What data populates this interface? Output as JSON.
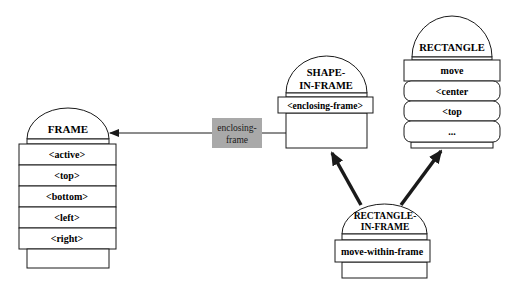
{
  "diagram": {
    "nodes": [
      {
        "id": "frame",
        "title": [
          "FRAME"
        ],
        "slots": [
          "<active>",
          "<top>",
          "<bottom>",
          "<left>",
          "<right>"
        ]
      },
      {
        "id": "shape-in-frame",
        "title": [
          "SHAPE-",
          "IN-FRAME"
        ],
        "slots": [
          "<enclosing-frame>"
        ]
      },
      {
        "id": "rectangle",
        "title": [
          "RECTANGLE"
        ],
        "slots": [
          "move",
          "<center",
          "<top",
          "..."
        ]
      },
      {
        "id": "rectangle-in-frame",
        "title": [
          "RECTANGLE-",
          "IN-FRAME"
        ],
        "slots": [
          "move-within-frame"
        ]
      }
    ],
    "edges": [
      {
        "from": "shape-in-frame",
        "to": "frame",
        "label": [
          "enclosing-",
          "frame"
        ],
        "style": "thin"
      },
      {
        "from": "rectangle-in-frame",
        "to": "shape-in-frame",
        "label": [],
        "style": "thick"
      },
      {
        "from": "rectangle-in-frame",
        "to": "rectangle",
        "label": [],
        "style": "thick"
      }
    ],
    "colors": {
      "stroke": "#1a1a1a",
      "edge_label_fill": "#a9a9a9",
      "background": "#ffffff"
    }
  }
}
